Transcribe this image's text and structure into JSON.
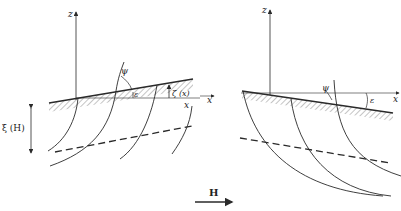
{
  "figure": {
    "colors": {
      "ink": "#2a2a2a",
      "background": "#ffffff"
    }
  },
  "left_panel": {
    "z_label": "z",
    "x_label": "x",
    "psi_label": "ψ",
    "epsilon_label": "ε",
    "zeta_label": "ζ (x)",
    "xi_label": "ξ (H)"
  },
  "right_panel": {
    "z_label": "z",
    "x_label": "x",
    "psi_label": "ψ",
    "epsilon_label": "ε"
  },
  "field_arrow": {
    "label": "H"
  }
}
